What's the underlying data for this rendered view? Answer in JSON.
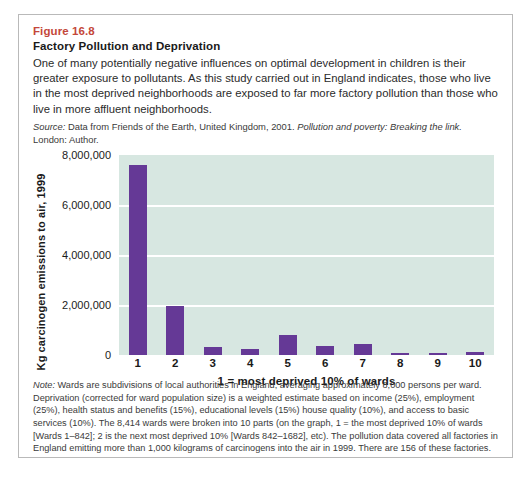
{
  "figure": {
    "number": "Figure 16.8",
    "title": "Factory Pollution and Deprivation",
    "description": "One of many potentially negative influences on optimal development in children is their greater exposure to pollutants. As this study carried out in England indicates, those who live in the most deprived neighborhoods are exposed to far more factory pollution than those who live in more affluent neighborhoods.",
    "source_label": "Source:",
    "source_text_before": " Data from Friends of the Earth, United Kingdom, 2001. ",
    "source_italic": "Pollution and poverty: Breaking the link.",
    "source_text_after": " London: Author.",
    "note_label": "Note:",
    "note_text": " Wards are subdivisions of local authorities in England, averaging approximately 8,000 persons per ward. Deprivation (corrected for ward population size) is a weighted estimate based on income (25%), employment (25%), health status and benefits (15%), educational levels (15%) house quality (10%), and access to basic services (10%). The 8,414 wards were broken into 10 parts (on the graph, 1 = the most deprived 10% of wards [Wards 1–842]; 2 is the next most deprived 10% [Wards 842–1682], etc). The pollution data covered all factories in England emitting more than 1,000 kilograms of carcinogens into the air in 1999. There are 156 of these factories."
  },
  "colors": {
    "figure_number": "#c4473a",
    "bar": "#653996",
    "plot_background": "#d7e7e1",
    "gridline": "#ffffff",
    "border": "#b9b9b9"
  },
  "chart_data": {
    "type": "bar",
    "title": "",
    "xlabel": "1 = most deprived 10% of wards",
    "ylabel": "Kg carcinogen emissions to air, 1999",
    "categories": [
      "1",
      "2",
      "3",
      "4",
      "5",
      "6",
      "7",
      "8",
      "9",
      "10"
    ],
    "values": [
      7600000,
      1950000,
      330000,
      230000,
      800000,
      370000,
      450000,
      90000,
      70000,
      130000
    ],
    "ylim": [
      0,
      8000000
    ],
    "ytick_values": [
      0,
      2000000,
      4000000,
      6000000,
      8000000
    ],
    "ytick_labels": [
      "0",
      "2,000,000",
      "4,000,000",
      "6,000,000",
      "8,000,000"
    ],
    "grid": true,
    "legend": "none",
    "series": [
      {
        "name": "Kg carcinogen emissions to air, 1999",
        "values": [
          7600000,
          1950000,
          330000,
          230000,
          800000,
          370000,
          450000,
          90000,
          70000,
          130000
        ]
      }
    ]
  }
}
